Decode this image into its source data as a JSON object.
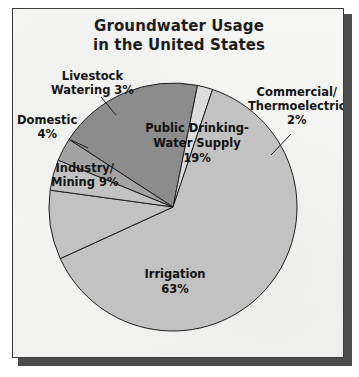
{
  "figure": {
    "title_line1": "Groundwater Usage",
    "title_line2": "in the United States",
    "panel_background": "#f4f4f2",
    "border_color": "#3a3a3a",
    "shadow_color": "#4c4c4c",
    "text_color": "#141414"
  },
  "chart_data": {
    "type": "pie",
    "title": "Groundwater Usage in the United States",
    "xlabel": "",
    "ylabel": "",
    "units": "percent",
    "total": 100,
    "legend_position": "none",
    "grid": false,
    "labels_inside": [
      "Public Drinking-Water Supply",
      "Irrigation"
    ],
    "labels_outside": [
      "Livestock Watering",
      "Domestic",
      "Industry/Mining",
      "Commercial/Thermoelectric"
    ],
    "categories": [
      "Public Drinking-Water Supply",
      "Commercial/Thermoelectric",
      "Irrigation",
      "Industry/Mining",
      "Domestic",
      "Livestock Watering"
    ],
    "values": [
      19,
      2,
      63,
      9,
      4,
      3
    ],
    "colors": [
      "#8c8c8c",
      "#dcdcdc",
      "#c2c2c2",
      "#c2c2c2",
      "#c2c2c2",
      "#a3a3a3"
    ],
    "slices": [
      {
        "name": "Public Drinking-Water Supply",
        "label_line1": "Public Drinking-",
        "label_line2": "Water Supply",
        "value": 19,
        "value_text": "19%",
        "color": "#8c8c8c",
        "start_deg": -57,
        "end_deg": 11.4
      },
      {
        "name": "Commercial/Thermoelectric",
        "label_line1": "Commercial/",
        "label_line2": "Thermoelectric",
        "value": 2,
        "value_text": "2%",
        "color": "#dcdcdc",
        "start_deg": 11.4,
        "end_deg": 18.6
      },
      {
        "name": "Irrigation",
        "label_line1": "Irrigation",
        "label_line2": "",
        "value": 63,
        "value_text": "63%",
        "color": "#c2c2c2",
        "start_deg": 18.6,
        "end_deg": 245.4
      },
      {
        "name": "Industry/Mining",
        "label_line1": "Industry/",
        "label_line2": "Mining 9%",
        "value": 9,
        "value_text": "9%",
        "color": "#c2c2c2",
        "start_deg": 245.4,
        "end_deg": 277.8
      },
      {
        "name": "Domestic",
        "label_line1": "Domestic",
        "label_line2": "4%",
        "value": 4,
        "value_text": "4%",
        "color": "#c2c2c2",
        "start_deg": 277.8,
        "end_deg": 292.2
      },
      {
        "name": "Livestock Watering",
        "label_line1": "Livestock",
        "label_line2": "Watering 3%",
        "value": 3,
        "value_text": "3%",
        "color": "#a3a3a3",
        "start_deg": 292.2,
        "end_deg": 303
      }
    ],
    "geometry": {
      "center_x": 160,
      "center_y": 198,
      "radius": 124
    }
  }
}
